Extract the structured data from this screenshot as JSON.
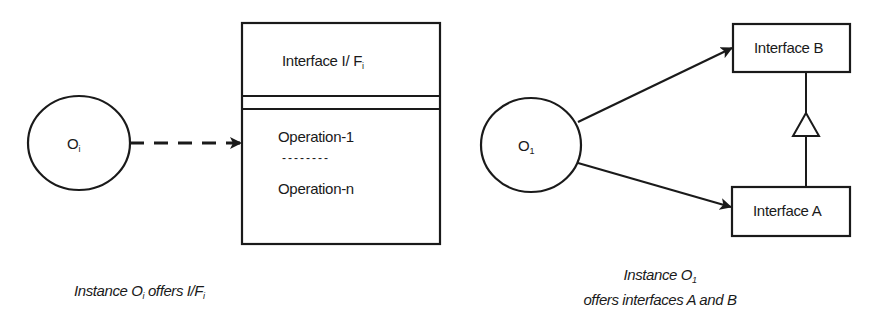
{
  "left_diagram": {
    "instance": {
      "base": "O",
      "sub": "i"
    },
    "interface_box": {
      "title": {
        "base": "Interface I/ F",
        "sub": "i"
      },
      "operations": [
        "Operation-1",
        "--------",
        "Operation-n"
      ]
    },
    "connector": "dashed-arrow",
    "caption": {
      "prefix": "Instance O",
      "sub1": "i",
      "middle": " offers I/F",
      "sub2": "i"
    }
  },
  "right_diagram": {
    "instance": {
      "base": "O",
      "sub": "1"
    },
    "interface_b": "Interface B",
    "interface_a": "Interface A",
    "relation": "generalization (A extends B)",
    "caption": {
      "line1_prefix": "Instance O",
      "line1_sub": "1",
      "line2": "offers interfaces A and B"
    }
  },
  "colors": {
    "stroke": "#1a1a1a",
    "background": "#ffffff"
  }
}
